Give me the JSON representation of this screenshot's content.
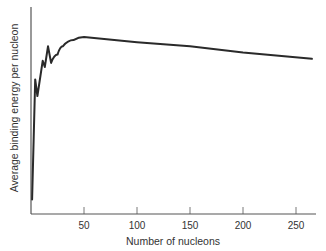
{
  "chart_data": {
    "type": "line",
    "title": "",
    "xlabel": "Number of nucleons",
    "ylabel": "Average binding energy per nucleon",
    "xlim": [
      0,
      270
    ],
    "ylim": [
      0,
      1
    ],
    "xticks": [
      50,
      100,
      150,
      200,
      250
    ],
    "xtick_labels": [
      "50",
      "100",
      "150",
      "200",
      "250"
    ],
    "yticks": [],
    "grid": false,
    "legend": null,
    "series": [
      {
        "name": "binding energy curve (relative units)",
        "x": [
          1,
          4,
          6,
          11,
          13,
          16,
          19,
          25,
          30,
          40,
          50,
          100,
          150,
          200,
          265
        ],
        "y": [
          0.07,
          0.65,
          0.57,
          0.74,
          0.71,
          0.81,
          0.73,
          0.77,
          0.81,
          0.84,
          0.855,
          0.83,
          0.81,
          0.78,
          0.75
        ]
      }
    ],
    "line_color": "#2a2a2a",
    "axis_color": "#555555"
  }
}
